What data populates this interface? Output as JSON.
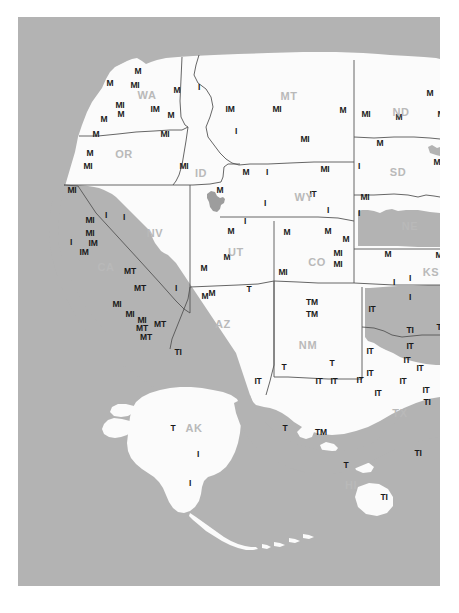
{
  "map": {
    "title": "Western United States distribution map",
    "background_color": "#b3b3b3",
    "land_color": "#fbfbfb",
    "border_color": "#555555",
    "marker_color": "#1a1a1a",
    "state_label_color": "#b9b9b9",
    "canvas": {
      "x": 18,
      "y": 17,
      "width": 422,
      "height": 569
    },
    "state_labels": [
      {
        "code": "WA",
        "x": 129,
        "y": 78
      },
      {
        "code": "OR",
        "x": 106,
        "y": 137
      },
      {
        "code": "ID",
        "x": 183,
        "y": 156
      },
      {
        "code": "MT",
        "x": 271,
        "y": 79
      },
      {
        "code": "ND",
        "x": 383,
        "y": 95
      },
      {
        "code": "SD",
        "x": 380,
        "y": 155
      },
      {
        "code": "WY",
        "x": 286,
        "y": 180
      },
      {
        "code": "NE",
        "x": 392,
        "y": 209
      },
      {
        "code": "NV",
        "x": 137,
        "y": 216
      },
      {
        "code": "UT",
        "x": 218,
        "y": 235
      },
      {
        "code": "CO",
        "x": 299,
        "y": 245
      },
      {
        "code": "KS",
        "x": 413,
        "y": 255
      },
      {
        "code": "CA",
        "x": 88,
        "y": 250
      },
      {
        "code": "AZ",
        "x": 205,
        "y": 307
      },
      {
        "code": "NM",
        "x": 290,
        "y": 328
      },
      {
        "code": "TX",
        "x": 382,
        "y": 396
      },
      {
        "code": "AK",
        "x": 176,
        "y": 411
      },
      {
        "code": "HI",
        "x": 333,
        "y": 468
      }
    ],
    "markers": [
      {
        "label": "M",
        "x": 120,
        "y": 54
      },
      {
        "label": "M",
        "x": 92,
        "y": 66
      },
      {
        "label": "MI",
        "x": 117,
        "y": 68
      },
      {
        "label": "M",
        "x": 159,
        "y": 73
      },
      {
        "label": "MI",
        "x": 102,
        "y": 88
      },
      {
        "label": "M",
        "x": 103,
        "y": 97
      },
      {
        "label": "IM",
        "x": 137,
        "y": 92
      },
      {
        "label": "M",
        "x": 153,
        "y": 98
      },
      {
        "label": "M",
        "x": 86,
        "y": 102
      },
      {
        "label": "MI",
        "x": 147,
        "y": 117
      },
      {
        "label": "M",
        "x": 78,
        "y": 117
      },
      {
        "label": "M",
        "x": 72,
        "y": 136
      },
      {
        "label": "MI",
        "x": 70,
        "y": 149
      },
      {
        "label": "MI",
        "x": 166,
        "y": 149
      },
      {
        "label": "I",
        "x": 181,
        "y": 70
      },
      {
        "label": "IM",
        "x": 212,
        "y": 92
      },
      {
        "label": "I",
        "x": 218,
        "y": 114
      },
      {
        "label": "M",
        "x": 228,
        "y": 155
      },
      {
        "label": "M",
        "x": 202,
        "y": 173
      },
      {
        "label": "MI",
        "x": 259,
        "y": 92
      },
      {
        "label": "M",
        "x": 325,
        "y": 93
      },
      {
        "label": "MI",
        "x": 287,
        "y": 122
      },
      {
        "label": "MI",
        "x": 307,
        "y": 152
      },
      {
        "label": "MI",
        "x": 348,
        "y": 97
      },
      {
        "label": "M",
        "x": 412,
        "y": 76
      },
      {
        "label": "M",
        "x": 381,
        "y": 100
      },
      {
        "label": "MI",
        "x": 424,
        "y": 97
      },
      {
        "label": "M",
        "x": 362,
        "y": 126
      },
      {
        "label": "M",
        "x": 419,
        "y": 145
      },
      {
        "label": "I",
        "x": 341,
        "y": 149
      },
      {
        "label": "I",
        "x": 429,
        "y": 166
      },
      {
        "label": "MI",
        "x": 347,
        "y": 180
      },
      {
        "label": "I",
        "x": 249,
        "y": 155
      },
      {
        "label": "I",
        "x": 247,
        "y": 186
      },
      {
        "label": "IT",
        "x": 295,
        "y": 177
      },
      {
        "label": "I",
        "x": 310,
        "y": 193
      },
      {
        "label": "I",
        "x": 341,
        "y": 196
      },
      {
        "label": "MI",
        "x": 54,
        "y": 173
      },
      {
        "label": "MI",
        "x": 72,
        "y": 203
      },
      {
        "label": "I",
        "x": 88,
        "y": 198
      },
      {
        "label": "I",
        "x": 106,
        "y": 200
      },
      {
        "label": "MI",
        "x": 72,
        "y": 216
      },
      {
        "label": "I",
        "x": 53,
        "y": 225
      },
      {
        "label": "IM",
        "x": 75,
        "y": 226
      },
      {
        "label": "IM",
        "x": 66,
        "y": 235
      },
      {
        "label": "MT",
        "x": 112,
        "y": 254
      },
      {
        "label": "MT",
        "x": 122,
        "y": 271
      },
      {
        "label": "MI",
        "x": 99,
        "y": 287
      },
      {
        "label": "MI",
        "x": 112,
        "y": 297
      },
      {
        "label": "MI",
        "x": 124,
        "y": 303
      },
      {
        "label": "MT",
        "x": 124,
        "y": 311
      },
      {
        "label": "MT",
        "x": 142,
        "y": 307
      },
      {
        "label": "MT",
        "x": 128,
        "y": 320
      },
      {
        "label": "TI",
        "x": 160,
        "y": 335
      },
      {
        "label": "I",
        "x": 158,
        "y": 271
      },
      {
        "label": "M",
        "x": 187,
        "y": 279
      },
      {
        "label": "I",
        "x": 227,
        "y": 204
      },
      {
        "label": "M",
        "x": 213,
        "y": 214
      },
      {
        "label": "M",
        "x": 209,
        "y": 240
      },
      {
        "label": "M",
        "x": 186,
        "y": 251
      },
      {
        "label": "M",
        "x": 194,
        "y": 276
      },
      {
        "label": "T",
        "x": 231,
        "y": 272
      },
      {
        "label": "M",
        "x": 269,
        "y": 215
      },
      {
        "label": "M",
        "x": 310,
        "y": 214
      },
      {
        "label": "M",
        "x": 328,
        "y": 222
      },
      {
        "label": "MI",
        "x": 320,
        "y": 236
      },
      {
        "label": "MI",
        "x": 320,
        "y": 247
      },
      {
        "label": "MI",
        "x": 265,
        "y": 255
      },
      {
        "label": "M",
        "x": 370,
        "y": 237
      },
      {
        "label": "M",
        "x": 421,
        "y": 238
      },
      {
        "label": "I",
        "x": 376,
        "y": 265
      },
      {
        "label": "I",
        "x": 392,
        "y": 261
      },
      {
        "label": "TM",
        "x": 294,
        "y": 285
      },
      {
        "label": "TM",
        "x": 294,
        "y": 297
      },
      {
        "label": "T",
        "x": 266,
        "y": 350
      },
      {
        "label": "T",
        "x": 314,
        "y": 346
      },
      {
        "label": "IT",
        "x": 354,
        "y": 292
      },
      {
        "label": "I",
        "x": 392,
        "y": 280
      },
      {
        "label": "TI",
        "x": 392,
        "y": 313
      },
      {
        "label": "TI",
        "x": 422,
        "y": 310
      },
      {
        "label": "IT",
        "x": 392,
        "y": 329
      },
      {
        "label": "IT",
        "x": 352,
        "y": 334
      },
      {
        "label": "IT",
        "x": 389,
        "y": 343
      },
      {
        "label": "IT",
        "x": 352,
        "y": 356
      },
      {
        "label": "IT",
        "x": 402,
        "y": 351
      },
      {
        "label": "IT",
        "x": 385,
        "y": 364
      },
      {
        "label": "IT",
        "x": 342,
        "y": 363
      },
      {
        "label": "IT",
        "x": 301,
        "y": 364
      },
      {
        "label": "IT",
        "x": 316,
        "y": 364
      },
      {
        "label": "IT",
        "x": 360,
        "y": 376
      },
      {
        "label": "IT",
        "x": 408,
        "y": 373
      },
      {
        "label": "TI",
        "x": 409,
        "y": 385
      },
      {
        "label": "IT",
        "x": 240,
        "y": 364
      },
      {
        "label": "T",
        "x": 155,
        "y": 411
      },
      {
        "label": "I",
        "x": 180,
        "y": 437
      },
      {
        "label": "I",
        "x": 172,
        "y": 466
      },
      {
        "label": "T",
        "x": 267,
        "y": 411
      },
      {
        "label": "TM",
        "x": 303,
        "y": 415
      },
      {
        "label": "T",
        "x": 328,
        "y": 448
      },
      {
        "label": "TI",
        "x": 400,
        "y": 436
      },
      {
        "label": "TI",
        "x": 366,
        "y": 480
      }
    ]
  }
}
